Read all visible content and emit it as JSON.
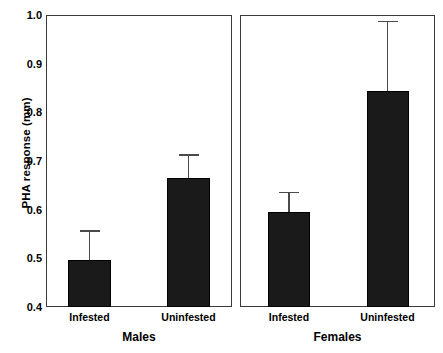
{
  "chart_data": {
    "type": "bar",
    "title": "",
    "xlabel": "",
    "ylabel": "PHA response (mm)",
    "ylim": [
      0.4,
      1.0
    ],
    "yticks": [
      "0.4",
      "0.5",
      "0.6",
      "0.7",
      "0.8",
      "0.9",
      "1.0"
    ],
    "ytick_values": [
      0.4,
      0.5,
      0.6,
      0.7,
      0.8,
      0.9,
      1.0
    ],
    "grid": false,
    "legend": "none",
    "panels": [
      {
        "name": "Males",
        "categories": [
          "Infested",
          "Uninfested"
        ],
        "values": [
          0.497,
          0.665
        ],
        "errors_upper": [
          0.558,
          0.714
        ]
      },
      {
        "name": "Females",
        "categories": [
          "Infested",
          "Uninfested"
        ],
        "values": [
          0.595,
          0.843
        ],
        "errors_upper": [
          0.637,
          0.988
        ]
      }
    ],
    "bar_color": "#1a1a1a",
    "axis_color": "#3a3a3a",
    "errorbar_color": "#4a4a4a"
  }
}
